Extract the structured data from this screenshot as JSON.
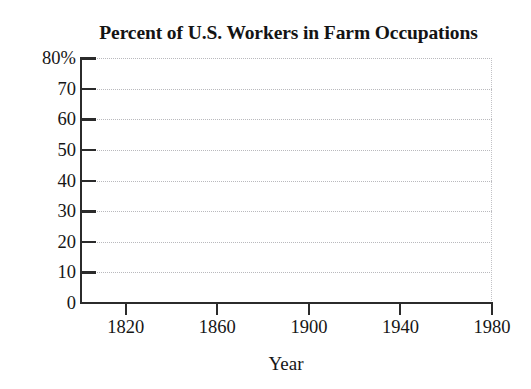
{
  "chart_data": {
    "type": "line",
    "title": "Percent of U.S. Workers in Farm Occupations",
    "xlabel": "Year",
    "ylabel": "",
    "xlim": [
      1800,
      1980
    ],
    "ylim": [
      0,
      80
    ],
    "grid": true,
    "legend": null,
    "series": [],
    "x_ticks": [
      {
        "value": 1820,
        "label": "1820"
      },
      {
        "value": 1860,
        "label": "1860"
      },
      {
        "value": 1900,
        "label": "1900"
      },
      {
        "value": 1940,
        "label": "1940"
      },
      {
        "value": 1980,
        "label": "1980"
      }
    ],
    "y_ticks": [
      {
        "value": 80,
        "label": "80%"
      },
      {
        "value": 70,
        "label": "70"
      },
      {
        "value": 60,
        "label": "60"
      },
      {
        "value": 50,
        "label": "50"
      },
      {
        "value": 40,
        "label": "40"
      },
      {
        "value": 30,
        "label": "30"
      },
      {
        "value": 20,
        "label": "20"
      },
      {
        "value": 10,
        "label": "10"
      },
      {
        "value": 0,
        "label": "0"
      }
    ],
    "colors": {
      "background": "#ffffff",
      "axis": "#2b2b2b",
      "gridline": "#b9b9bd",
      "text": "#161616"
    }
  }
}
